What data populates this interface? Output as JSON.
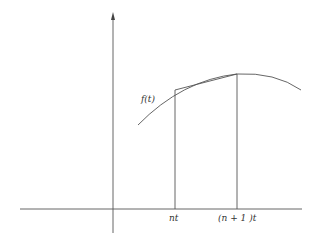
{
  "diagram": {
    "type": "function-plot-with-chord",
    "labels": {
      "function": "f(t)",
      "x_tick_1": "nt",
      "x_tick_2": "(n + 1 )t"
    },
    "colors": {
      "stroke": "#555555",
      "text": "#333333",
      "background": "#ffffff"
    },
    "elements": [
      "x-axis",
      "y-axis with arrow",
      "concave curve f(t)",
      "vertical line at nt",
      "vertical line at (n+1)t",
      "chord between curve points at nt and (n+1)t"
    ]
  }
}
